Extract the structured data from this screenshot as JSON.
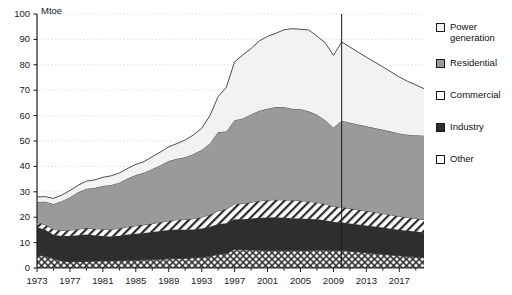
{
  "header": {
    "clipped_title": "▪                      —                  —"
  },
  "chart_data": {
    "type": "area",
    "stacked": true,
    "title": "",
    "xlabel": "",
    "ylabel": "Mtoe",
    "unit_label": "Mtoe",
    "ylim": [
      0,
      100
    ],
    "ytick_step": 10,
    "yticks": [
      0,
      10,
      20,
      30,
      40,
      50,
      60,
      70,
      80,
      90,
      100
    ],
    "xlim": [
      1973,
      2020
    ],
    "xticks": [
      1973,
      1977,
      1981,
      1985,
      1989,
      1993,
      1997,
      2001,
      2005,
      2009,
      2013,
      2017
    ],
    "xtick_minor_step": 2,
    "grid": "horizontal-dotted",
    "legend_position": "right",
    "projection_divider_year": 2010,
    "x": [
      1973,
      1974,
      1975,
      1976,
      1977,
      1978,
      1979,
      1980,
      1981,
      1982,
      1983,
      1984,
      1985,
      1986,
      1987,
      1988,
      1989,
      1990,
      1991,
      1992,
      1993,
      1994,
      1995,
      1996,
      1997,
      1998,
      1999,
      2000,
      2001,
      2002,
      2003,
      2004,
      2005,
      2006,
      2007,
      2008,
      2009,
      2010,
      2011,
      2012,
      2013,
      2014,
      2015,
      2016,
      2017,
      2018,
      2019,
      2020
    ],
    "series": [
      {
        "name": "Other",
        "fill": "cross-hatch",
        "color": "#ffffff",
        "values": [
          5.0,
          4.6,
          3.6,
          2.8,
          2.4,
          2.5,
          2.6,
          2.7,
          2.8,
          2.8,
          2.9,
          3.0,
          3.1,
          3.2,
          3.3,
          3.4,
          3.6,
          3.7,
          3.8,
          4.0,
          4.2,
          4.6,
          5.4,
          5.6,
          7.4,
          7.2,
          7.1,
          7.0,
          6.9,
          6.9,
          6.8,
          6.8,
          6.9,
          6.9,
          7.0,
          7.0,
          6.9,
          7.0,
          6.6,
          6.3,
          6.0,
          5.7,
          5.4,
          5.1,
          4.8,
          4.5,
          4.3,
          4.1
        ]
      },
      {
        "name": "Industry",
        "fill": "solid-dark",
        "color": "#2e2e2e",
        "values": [
          11.0,
          10.5,
          9.5,
          9.8,
          10.2,
          10.4,
          10.6,
          10.2,
          9.8,
          9.6,
          9.8,
          10.2,
          10.4,
          10.6,
          10.9,
          11.2,
          11.4,
          11.5,
          11.3,
          11.2,
          11.4,
          11.6,
          11.9,
          12.0,
          11.8,
          12.0,
          12.4,
          12.8,
          13.0,
          13.1,
          13.0,
          12.8,
          12.6,
          12.4,
          12.2,
          11.8,
          11.2,
          11.0,
          10.9,
          10.8,
          10.7,
          10.6,
          10.5,
          10.4,
          10.3,
          10.2,
          10.1,
          10.0
        ]
      },
      {
        "name": "Commercial",
        "fill": "diagonal-hatch",
        "color": "#ffffff",
        "values": [
          2.0,
          2.0,
          2.1,
          2.2,
          2.3,
          2.4,
          2.5,
          2.6,
          2.7,
          2.8,
          2.9,
          3.0,
          3.1,
          3.2,
          3.3,
          3.4,
          3.6,
          3.8,
          4.0,
          4.2,
          4.4,
          4.8,
          5.2,
          5.6,
          6.0,
          6.2,
          6.4,
          6.6,
          6.8,
          6.9,
          7.0,
          7.1,
          7.0,
          6.9,
          6.6,
          6.4,
          6.1,
          6.0,
          5.9,
          5.8,
          5.7,
          5.6,
          5.5,
          5.4,
          5.3,
          5.2,
          5.1,
          5.0
        ]
      },
      {
        "name": "Residential",
        "fill": "solid-gray",
        "color": "#9a9a9a",
        "values": [
          8.0,
          9.0,
          10.0,
          11.5,
          13.0,
          14.5,
          15.5,
          16.0,
          17.0,
          17.5,
          18.0,
          19.0,
          20.0,
          20.5,
          21.5,
          22.5,
          23.5,
          24.0,
          24.5,
          25.5,
          26.5,
          28.0,
          31.0,
          30.5,
          33.0,
          33.5,
          34.5,
          35.5,
          36.0,
          36.5,
          36.5,
          36.0,
          36.0,
          35.5,
          34.5,
          33.0,
          31.0,
          34.0,
          33.8,
          33.6,
          33.4,
          33.2,
          33.0,
          32.8,
          32.6,
          32.6,
          32.8,
          33.0
        ]
      },
      {
        "name": "Power generation",
        "fill": "solid-light",
        "color": "#f2f2f2",
        "values": [
          2.0,
          2.0,
          2.2,
          2.4,
          2.6,
          2.8,
          3.0,
          3.2,
          3.4,
          3.6,
          3.8,
          4.0,
          4.2,
          4.4,
          4.8,
          5.2,
          5.6,
          6.0,
          6.8,
          7.5,
          8.5,
          11.0,
          14.0,
          17.5,
          23.0,
          25.0,
          26.0,
          27.5,
          28.5,
          29.0,
          30.5,
          31.5,
          31.5,
          32.0,
          31.0,
          30.5,
          28.5,
          31.0,
          29.8,
          28.5,
          27.2,
          26.0,
          24.8,
          23.5,
          22.2,
          21.0,
          19.8,
          18.5
        ]
      }
    ],
    "totals_note": "values are series magnitudes; stacking order bottom→top: Other, Industry, Commercial, Residential, Power generation"
  },
  "legend": {
    "items": [
      {
        "label": "Power\ngeneration",
        "swatch": "white-box"
      },
      {
        "label": "Residential",
        "swatch": "gray-box"
      },
      {
        "label": "Commercial",
        "swatch": "diagonal-hatch-box"
      },
      {
        "label": "Industry",
        "swatch": "dark-box"
      },
      {
        "label": "Other",
        "swatch": "cross-hatch-box"
      }
    ]
  }
}
